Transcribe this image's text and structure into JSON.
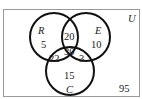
{
  "diagram": {
    "type": "venn",
    "universe_label": "U",
    "sets": [
      {
        "label": "R",
        "cx": 54,
        "cy": 37,
        "r": 24
      },
      {
        "label": "E",
        "cx": 86,
        "cy": 37,
        "r": 24
      },
      {
        "label": "C",
        "cx": 70,
        "cy": 71,
        "r": 24
      }
    ],
    "regions": {
      "R_only": "5",
      "E_only": "10",
      "C_only": "15",
      "R_and_E_only": "20",
      "R_and_C_only": "22",
      "E_and_C_only": "3",
      "R_and_E_and_C": "30",
      "outside": "95"
    },
    "colors": {
      "stroke": "#111111",
      "frame": "#999999",
      "text": "#222222"
    }
  }
}
